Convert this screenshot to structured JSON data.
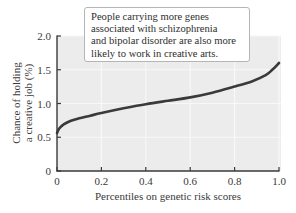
{
  "chart_data": {
    "type": "line",
    "title": "",
    "xlabel": "Percentiles on genetic risk scores",
    "ylabel": [
      "Chance of holding",
      "a creative job (%)"
    ],
    "xlim": [
      0,
      1.0
    ],
    "ylim": [
      0,
      2.0
    ],
    "x_ticks": [
      0,
      0.2,
      0.4,
      0.6,
      0.8,
      1.0
    ],
    "x_tick_labels": [
      "0",
      "0.2",
      "0.4",
      "0.6",
      "0.8",
      "1.0"
    ],
    "y_ticks": [
      0,
      0.5,
      1.0,
      1.5,
      2.0
    ],
    "y_tick_labels": [
      "0",
      "0.5",
      "1.0",
      "1.5",
      "2.0"
    ],
    "grid": true,
    "legend": null,
    "series": [
      {
        "name": "Chance of holding a creative job",
        "color": "#3a3a3a",
        "x": [
          0,
          0.01,
          0.03,
          0.06,
          0.1,
          0.15,
          0.2,
          0.3,
          0.4,
          0.5,
          0.6,
          0.7,
          0.8,
          0.88,
          0.94,
          0.97,
          1.0
        ],
        "y": [
          0.56,
          0.63,
          0.69,
          0.74,
          0.78,
          0.82,
          0.86,
          0.93,
          0.99,
          1.04,
          1.09,
          1.16,
          1.25,
          1.33,
          1.42,
          1.5,
          1.6
        ]
      }
    ],
    "annotation": {
      "lines": [
        "People carrying more genes",
        "associated with schizophrenia",
        "and bipolar disorder are also more",
        "likely to work in creative arts."
      ]
    }
  },
  "colors": {
    "plot_background": "#ececec",
    "gridline": "#f8f8f8",
    "axis": "#3a3a3a",
    "curve": "#3a3a3a"
  }
}
